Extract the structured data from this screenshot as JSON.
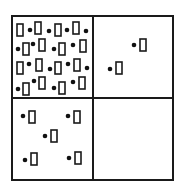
{
  "diagram": {
    "type": "2x2-grid-particle-distribution",
    "background": "#ffffff",
    "stroke_color": "#1a1a1a",
    "fill_color": "#111111",
    "grid": {
      "x": 12,
      "y": 16,
      "width": 161,
      "height": 164,
      "mid_x": 93,
      "mid_y": 98,
      "stroke_width": 2
    },
    "rect_size": {
      "w": 6,
      "h": 12
    },
    "dot_radius": 2.3,
    "quadrants": [
      {
        "name": "top-left",
        "description": "densely packed",
        "items": [
          {
            "kind": "rect",
            "x": 17,
            "y": 24
          },
          {
            "kind": "dot",
            "x": 30,
            "y": 30
          },
          {
            "kind": "rect",
            "x": 35,
            "y": 22
          },
          {
            "kind": "dot",
            "x": 49,
            "y": 31
          },
          {
            "kind": "rect",
            "x": 55,
            "y": 24
          },
          {
            "kind": "dot",
            "x": 67,
            "y": 30
          },
          {
            "kind": "rect",
            "x": 73,
            "y": 22
          },
          {
            "kind": "dot",
            "x": 86,
            "y": 31
          },
          {
            "kind": "dot",
            "x": 18,
            "y": 49
          },
          {
            "kind": "rect",
            "x": 23,
            "y": 43
          },
          {
            "kind": "dot",
            "x": 33,
            "y": 44
          },
          {
            "kind": "rect",
            "x": 39,
            "y": 39
          },
          {
            "kind": "dot",
            "x": 54,
            "y": 49
          },
          {
            "kind": "rect",
            "x": 59,
            "y": 43
          },
          {
            "kind": "dot",
            "x": 73,
            "y": 45
          },
          {
            "kind": "rect",
            "x": 80,
            "y": 40
          },
          {
            "kind": "rect",
            "x": 17,
            "y": 62
          },
          {
            "kind": "dot",
            "x": 29,
            "y": 64
          },
          {
            "kind": "rect",
            "x": 36,
            "y": 59
          },
          {
            "kind": "dot",
            "x": 50,
            "y": 69
          },
          {
            "kind": "rect",
            "x": 55,
            "y": 62
          },
          {
            "kind": "dot",
            "x": 68,
            "y": 64
          },
          {
            "kind": "rect",
            "x": 74,
            "y": 59
          },
          {
            "kind": "dot",
            "x": 87,
            "y": 68
          },
          {
            "kind": "dot",
            "x": 18,
            "y": 89
          },
          {
            "kind": "rect",
            "x": 23,
            "y": 83
          },
          {
            "kind": "dot",
            "x": 34,
            "y": 81
          },
          {
            "kind": "rect",
            "x": 39,
            "y": 77
          },
          {
            "kind": "dot",
            "x": 54,
            "y": 88
          },
          {
            "kind": "rect",
            "x": 59,
            "y": 82
          },
          {
            "kind": "dot",
            "x": 73,
            "y": 82
          },
          {
            "kind": "rect",
            "x": 79,
            "y": 77
          }
        ]
      },
      {
        "name": "top-right",
        "description": "sparse",
        "items": [
          {
            "kind": "dot",
            "x": 134,
            "y": 45
          },
          {
            "kind": "rect",
            "x": 140,
            "y": 39
          },
          {
            "kind": "dot",
            "x": 110,
            "y": 69
          },
          {
            "kind": "rect",
            "x": 116,
            "y": 62
          }
        ]
      },
      {
        "name": "bottom-left",
        "description": "moderate",
        "items": [
          {
            "kind": "dot",
            "x": 23,
            "y": 116
          },
          {
            "kind": "rect",
            "x": 29,
            "y": 111
          },
          {
            "kind": "dot",
            "x": 68,
            "y": 116
          },
          {
            "kind": "rect",
            "x": 74,
            "y": 111
          },
          {
            "kind": "dot",
            "x": 45,
            "y": 136
          },
          {
            "kind": "rect",
            "x": 51,
            "y": 130
          },
          {
            "kind": "dot",
            "x": 25,
            "y": 160
          },
          {
            "kind": "rect",
            "x": 31,
            "y": 153
          },
          {
            "kind": "dot",
            "x": 69,
            "y": 158
          },
          {
            "kind": "rect",
            "x": 75,
            "y": 152
          }
        ]
      },
      {
        "name": "bottom-right",
        "description": "empty",
        "items": []
      }
    ]
  }
}
